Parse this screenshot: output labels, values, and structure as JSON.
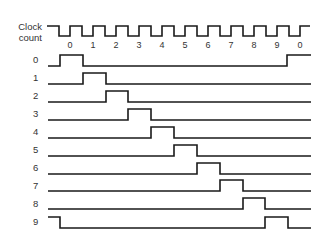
{
  "clock": {
    "label_line1": "Clock",
    "label_line2": "count",
    "tick_labels": [
      "0",
      "1",
      "2",
      "3",
      "4",
      "5",
      "6",
      "7",
      "8",
      "9",
      "0"
    ]
  },
  "rows": [
    {
      "label": "0"
    },
    {
      "label": "1"
    },
    {
      "label": "2"
    },
    {
      "label": "3"
    },
    {
      "label": "4"
    },
    {
      "label": "5"
    },
    {
      "label": "6"
    },
    {
      "label": "7"
    },
    {
      "label": "8"
    },
    {
      "label": "9"
    }
  ],
  "colors": {
    "line": "#1a1a1a",
    "text": "#333333",
    "background": "#ffffff"
  }
}
